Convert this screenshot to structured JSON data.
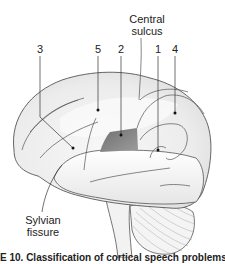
{
  "figure": {
    "labels": {
      "central_sulcus_line1": "Central",
      "central_sulcus_line2": "sulcus",
      "area_3": "3",
      "area_5": "5",
      "area_2": "2",
      "area_1": "1",
      "area_4": "4",
      "sylvian_line1": "Sylvian",
      "sylvian_line2": "fissure"
    },
    "caption": "E 10. Classification of cortical speech problems. (1) Wer",
    "colors": {
      "outline": "#555555",
      "brain_fill": "#eeeeee",
      "highlight_band": "#d8d8d8",
      "dark_region": "#8a8a8a",
      "leader_line": "#333333"
    }
  }
}
